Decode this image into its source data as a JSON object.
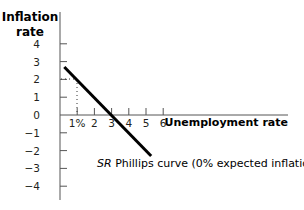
{
  "chart_data": {
    "type": "line",
    "title": "",
    "ylabel": "Inflation rate",
    "ylabel_lines": [
      "Inflation",
      "rate"
    ],
    "xlabel": "Unemployment rate",
    "x_ticks": [
      {
        "value": 1,
        "label": "1%"
      },
      {
        "value": 2,
        "label": "2"
      },
      {
        "value": 3,
        "label": "3"
      },
      {
        "value": 4,
        "label": "4"
      },
      {
        "value": 5,
        "label": "5"
      },
      {
        "value": 6,
        "label": "6"
      }
    ],
    "y_ticks": [
      {
        "value": 4,
        "label": "4"
      },
      {
        "value": 3,
        "label": "3"
      },
      {
        "value": 2,
        "label": "2"
      },
      {
        "value": 1,
        "label": "1"
      },
      {
        "value": 0,
        "label": "0"
      },
      {
        "value": -1,
        "label": "−1"
      },
      {
        "value": -2,
        "label": "−2"
      },
      {
        "value": -3,
        "label": "−3"
      },
      {
        "value": -4,
        "label": "−4"
      }
    ],
    "xlim": [
      0,
      13
    ],
    "ylim": [
      -4.8,
      5.7
    ],
    "grid": false,
    "series": [
      {
        "name": "SR Phillips curve (0% expected inflation)",
        "x": [
          0.25,
          5.3
        ],
        "y": [
          2.7,
          -2.3
        ],
        "color": "#000000"
      }
    ],
    "annotations": [
      {
        "type": "label",
        "text_italic": "SR",
        "text": " Phillips curve (0% expected inflation)",
        "at_series_end": true
      },
      {
        "type": "dotted_guide",
        "x": 1,
        "y": 2
      }
    ]
  }
}
